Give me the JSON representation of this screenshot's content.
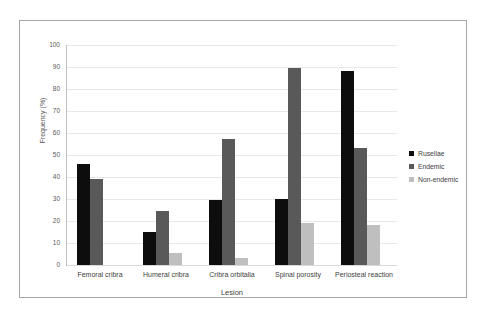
{
  "chart_data": {
    "type": "bar",
    "title": "",
    "xlabel": "Lesion",
    "ylabel": "Frequency (%)",
    "ylim": [
      0,
      100
    ],
    "ytick_step": 10,
    "yticks": [
      "100",
      "90",
      "80",
      "70",
      "60",
      "50",
      "40",
      "30",
      "20",
      "10",
      "0"
    ],
    "grid": true,
    "legend_position": "right",
    "categories": [
      "Femoral cribra",
      "Humeral cribra",
      "Cribra orbitalia",
      "Spinal porosity",
      "Periosteal reaction"
    ],
    "series": [
      {
        "name": "Rusellae",
        "color": "#0d0d0d",
        "values": [
          46,
          15,
          29.5,
          30,
          88
        ]
      },
      {
        "name": "Endemic",
        "color": "#595959",
        "values": [
          39,
          24.5,
          57.5,
          89.5,
          53
        ]
      },
      {
        "name": "Non-endemic",
        "color": "#bfbfbf",
        "values": [
          0,
          5.5,
          3,
          19,
          18
        ]
      }
    ]
  },
  "legend": {
    "items": [
      {
        "label": "Rusellae",
        "color": "#0d0d0d"
      },
      {
        "label": "Endemic",
        "color": "#595959"
      },
      {
        "label": "Non-endemic",
        "color": "#bfbfbf"
      }
    ]
  }
}
